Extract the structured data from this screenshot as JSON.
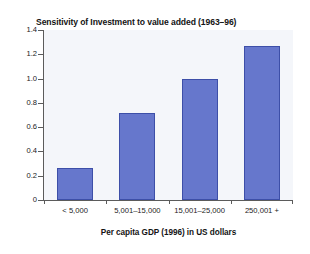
{
  "chart_data": {
    "type": "bar",
    "title": "Sensitivity of Investment to value added (1963–96)",
    "xlabel": "Per capita GDP (1996) in US dollars",
    "ylabel": "",
    "categories": [
      "< 5,000",
      "5,001–15,000",
      "15,001–25,000",
      "250,001 +"
    ],
    "values": [
      0.26,
      0.72,
      1.0,
      1.27
    ],
    "ylim": [
      0,
      1.4
    ],
    "ytick_values": [
      0,
      0.2,
      0.4,
      0.6,
      0.8,
      1.0,
      1.2,
      1.4
    ],
    "ytick_labels": [
      "0",
      "0.2",
      "0.4",
      "0.6",
      "0.8",
      "1.0",
      "1.2",
      "1.4"
    ],
    "grid": false,
    "legend": "none",
    "bar_color": "#6677cc",
    "bar_edge_color": "#3d4fa8",
    "plot_background": "#f4f6fa",
    "figure_background": "#ffffff",
    "axis_color": "#5b5b5b"
  }
}
